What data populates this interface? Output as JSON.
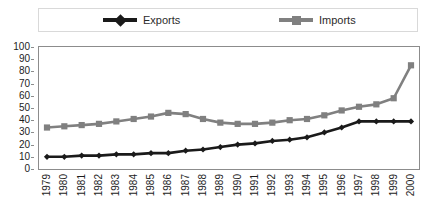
{
  "chart_data": {
    "type": "line",
    "title": "",
    "subtitle": "",
    "xlabel": "",
    "ylabel": "",
    "grid": false,
    "legend_position": "top",
    "categories": [
      "1979",
      "1980",
      "1981",
      "1982",
      "1983",
      "1984",
      "1985",
      "1986",
      "1987",
      "1988",
      "1989",
      "1990",
      "1991",
      "1992",
      "1993",
      "1994",
      "1995",
      "1996",
      "1997",
      "1998",
      "1999",
      "2000"
    ],
    "ylim": [
      0,
      100
    ],
    "yticks": [
      0,
      10,
      20,
      30,
      40,
      50,
      60,
      70,
      80,
      90,
      100
    ],
    "series": [
      {
        "name": "Exports",
        "color": "#1a1a1a",
        "marker": "diamond",
        "values": [
          10,
          10,
          11,
          11,
          12,
          12,
          13,
          13,
          15,
          16,
          18,
          20,
          21,
          23,
          24,
          26,
          30,
          34,
          39,
          39,
          39,
          39
        ]
      },
      {
        "name": "Imports",
        "color": "#808080",
        "marker": "square",
        "values": [
          34,
          35,
          36,
          37,
          39,
          41,
          43,
          46,
          45,
          41,
          38,
          37,
          37,
          38,
          40,
          41,
          44,
          48,
          51,
          53,
          58,
          85
        ]
      }
    ]
  },
  "legend": {
    "entries": [
      {
        "label": "Exports",
        "color": "#1a1a1a",
        "marker": "diamond"
      },
      {
        "label": "Imports",
        "color": "#808080",
        "marker": "square"
      }
    ]
  },
  "axes": {
    "y_tick_labels": [
      "100",
      "90",
      "80",
      "70",
      "60",
      "50",
      "40",
      "30",
      "20",
      "10",
      "0"
    ],
    "x_tick_labels": [
      "1979",
      "1980",
      "1981",
      "1982",
      "1983",
      "1984",
      "1985",
      "1986",
      "1987",
      "1988",
      "1989",
      "1990",
      "1991",
      "1992",
      "1993",
      "1994",
      "1995",
      "1996",
      "1997",
      "1998",
      "1999",
      "2000"
    ]
  },
  "icons": {
    "legend_marker_exports": "diamond-marker-icon",
    "legend_marker_imports": "square-marker-icon"
  }
}
